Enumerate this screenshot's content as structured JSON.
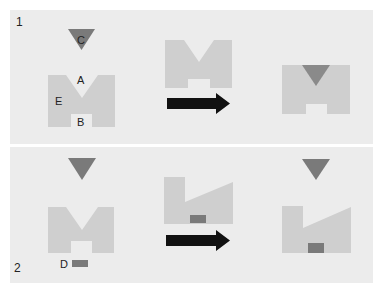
{
  "colors": {
    "background": "#ffffff",
    "panel": "#ececec",
    "shape": "#cfcfcf",
    "triangle": "#7a7a7a",
    "block": "#7a7a7a",
    "arrow": "#111111"
  },
  "panels": [
    {
      "number": "1",
      "labels": {
        "A": "A",
        "B": "B",
        "C": "C",
        "E": "E"
      },
      "steps": [
        "initial: triangle C above M-shaped body with notches A and B, side E",
        "arrow",
        "result: triangle fitted into notch A"
      ]
    },
    {
      "number": "2",
      "labels": {
        "D": "D"
      },
      "steps": [
        "initial: triangle above M-shaped body, block D below",
        "arrow",
        "result: block D fitted into bottom notch, body reshaped with sloped top"
      ]
    }
  ]
}
